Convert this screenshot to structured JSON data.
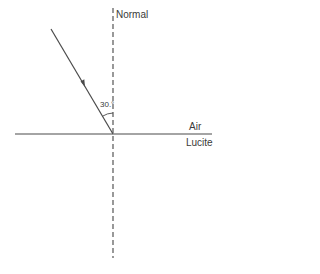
{
  "diagram": {
    "labels": {
      "normal": "Normal",
      "upper_medium": "Air",
      "lower_medium": "Lucite",
      "incident_angle": "30.°"
    },
    "elements": {
      "normal_line": {
        "style": "dashed",
        "x": 113,
        "y_top": 8,
        "y_bottom": 258
      },
      "interface_line": {
        "style": "solid",
        "y": 134,
        "x_left": 15,
        "x_right": 212
      },
      "incident_ray": {
        "style": "solid",
        "from": [
          51,
          29
        ],
        "to": [
          113,
          134
        ],
        "has_arrow": true
      },
      "angle_arc": {
        "between": [
          "incident_ray",
          "normal_line"
        ],
        "value_deg": 30
      }
    },
    "colors": {
      "line": "#4a4a4a",
      "text": "#3a3a3a",
      "background": "#ffffff"
    }
  }
}
